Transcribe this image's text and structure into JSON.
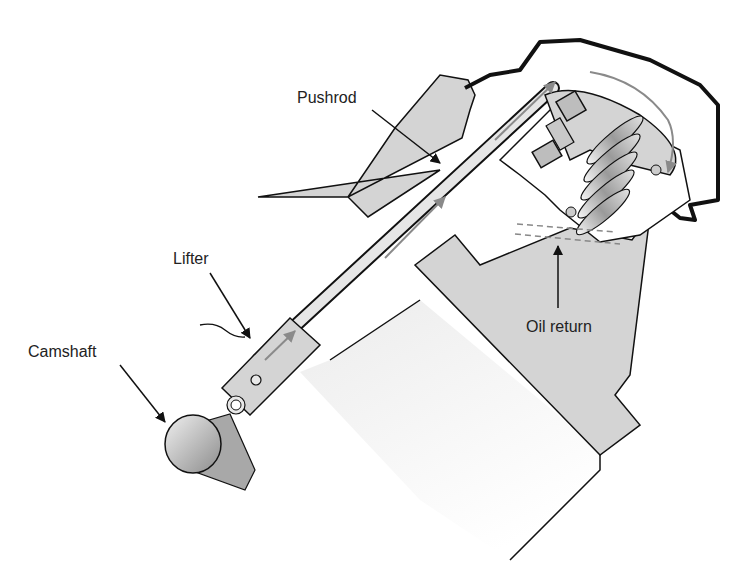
{
  "diagram": {
    "labels": {
      "pushrod": "Pushrod",
      "lifter": "Lifter",
      "camshaft": "Camshaft",
      "oil_return": "Oil return"
    },
    "colors": {
      "outline": "#111111",
      "part_fill": "#d4d4d4",
      "block_fill": "#f2f2f2",
      "oil_arrow": "#8a8a8a"
    }
  }
}
